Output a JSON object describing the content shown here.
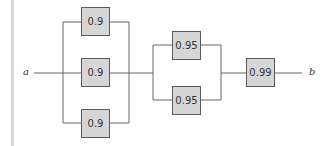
{
  "diagram": {
    "type": "reliability-block-diagram",
    "terminals": {
      "start": "a",
      "end": "b"
    },
    "stages": [
      {
        "name": "stage-1",
        "arrangement": "parallel",
        "components": [
          {
            "reliability": "0.9"
          },
          {
            "reliability": "0.9"
          },
          {
            "reliability": "0.9"
          }
        ]
      },
      {
        "name": "stage-2",
        "arrangement": "parallel",
        "components": [
          {
            "reliability": "0.95"
          },
          {
            "reliability": "0.95"
          }
        ]
      },
      {
        "name": "stage-3",
        "arrangement": "series",
        "components": [
          {
            "reliability": "0.99"
          }
        ]
      }
    ],
    "colors": {
      "block_fill": "#d6d6d6",
      "block_border": "#5a5a5a",
      "line": "#666666",
      "side_bar": "#d9d9d9"
    }
  }
}
